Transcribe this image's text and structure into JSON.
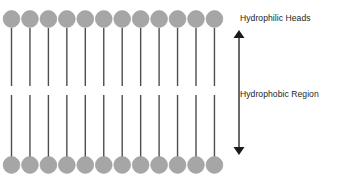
{
  "diagram": {
    "type": "phospholipid-bilayer",
    "canvas": {
      "width": 341,
      "height": 182,
      "background": "#ffffff"
    },
    "colors": {
      "head_fill": "#a6a6a6",
      "head_stroke": "#9c9c9c",
      "tail_stroke": "#4d4d4d",
      "arrow_stroke": "#1a1a1a",
      "label_text": "#221f1f"
    },
    "labels": {
      "hydrophilic_heads": "Hydrophilic Heads",
      "hydrophobic_region": "Hydrophobic Region"
    },
    "layers": {
      "count": 2,
      "upper": {
        "name": "upper-leaflet",
        "molecule_count": 12,
        "head_center_y": 19,
        "tail_start_y": 28,
        "tail_end_y": 86
      },
      "lower": {
        "name": "lower-leaflet",
        "molecule_count": 12,
        "head_center_y": 165,
        "tail_start_y": 95,
        "tail_end_y": 157
      }
    },
    "molecule": {
      "head_radius": 8.4,
      "tail_width": 1.4,
      "first_head_center_x": 11.5,
      "head_spacing_x": 18.45
    },
    "arrow": {
      "name": "hydrophobic-region-extent-arrow",
      "orientation": "vertical",
      "double_headed": true,
      "x": 239,
      "y_top": 30,
      "y_bottom": 155,
      "head_width": 5.5,
      "head_length": 8,
      "line_width": 1.3
    }
  },
  "chart_data": {
    "type": "diagram",
    "annotations": [
      "Hydrophilic Heads",
      "Hydrophobic Region"
    ],
    "series": [
      {
        "name": "upper-leaflet-heads",
        "count": 12
      },
      {
        "name": "lower-leaflet-heads",
        "count": 12
      }
    ]
  }
}
